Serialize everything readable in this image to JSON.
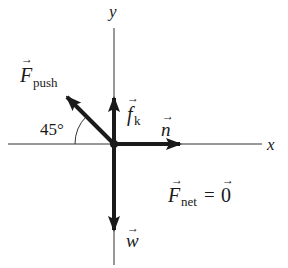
{
  "diagram": {
    "type": "free-body diagram",
    "axes": {
      "x_label": "x",
      "y_label": "y"
    },
    "forces": [
      {
        "id": "push",
        "symbol": "F",
        "subscript": "push",
        "direction": "up-left",
        "angle_label": "45°"
      },
      {
        "id": "friction",
        "symbol": "f",
        "subscript": "k",
        "direction": "up"
      },
      {
        "id": "normal",
        "symbol": "n",
        "subscript": "",
        "direction": "right"
      },
      {
        "id": "weight",
        "symbol": "w",
        "subscript": "",
        "direction": "down"
      }
    ],
    "equation": {
      "lhs_symbol": "F",
      "lhs_subscript": "net",
      "equals": "=",
      "rhs": "0"
    },
    "colors": {
      "ink": "#1a1a1a",
      "background": "#ffffff"
    }
  }
}
